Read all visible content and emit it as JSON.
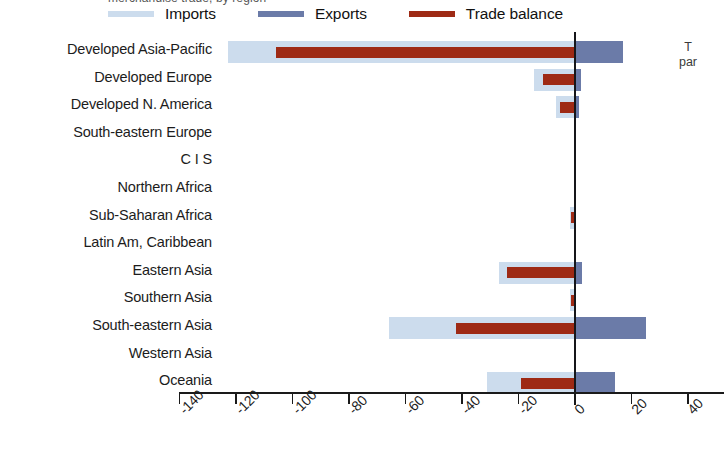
{
  "top_cut_text": "merchandise trade, by region",
  "legend": {
    "items": [
      {
        "label": "Imports",
        "color": "#ccdced",
        "icon": "legend-line-imports"
      },
      {
        "label": "Exports",
        "color": "#6b7ba8",
        "icon": "legend-line-exports"
      },
      {
        "label": "Trade balance",
        "color": "#9e2a15",
        "icon": "legend-line-trade-balance"
      }
    ]
  },
  "side_note": {
    "line1": "T",
    "line2": "par"
  },
  "colors": {
    "imports": "#ccdced",
    "exports": "#6b7ba8",
    "trade_balance": "#9e2a15",
    "axis": "#1a1a1a",
    "zero_line": "#16161a"
  },
  "chart_data": {
    "type": "bar",
    "orientation": "horizontal",
    "title": "",
    "subtitle": "",
    "xlabel": "",
    "ylabel": "",
    "xlim": [
      -145,
      45
    ],
    "xticks": [
      -140,
      -120,
      -100,
      -80,
      -60,
      -40,
      -20,
      0,
      20,
      40
    ],
    "xticklabels": [
      "-140",
      "-120",
      "-100",
      "-80",
      "-60",
      "-40",
      "-20",
      "0",
      "20",
      "40"
    ],
    "grid": false,
    "legend_position": "top",
    "categories": [
      "Developed Asia-Pacific",
      "Developed Europe",
      "Developed N. America",
      "South-eastern Europe",
      "C I S",
      "Northern Africa",
      "Sub-Saharan Africa",
      "Latin Am, Caribbean",
      "Eastern Asia",
      "Southern Asia",
      "South-eastern Asia",
      "Western Asia",
      "Oceania"
    ],
    "series": [
      {
        "name": "Imports",
        "color": "#ccdced",
        "note": "plotted as negative values extending left of zero",
        "values": [
          -123,
          -14.5,
          -6.7,
          -0.4,
          -0.3,
          -0.4,
          -1.6,
          -0.5,
          -27,
          -1.6,
          -66,
          -0.5,
          -31
        ]
      },
      {
        "name": "Exports",
        "color": "#6b7ba8",
        "note": "plotted as positive values extending right of zero",
        "values": [
          17,
          2,
          1.5,
          0.3,
          0.2,
          0.3,
          0.4,
          0.3,
          2.5,
          0.4,
          25,
          0.4,
          14
        ]
      },
      {
        "name": "Trade balance",
        "color": "#9e2a15",
        "note": "net balance bar drawn from its value to zero",
        "values": [
          -106,
          -11.5,
          -5.2,
          -0.2,
          -0.2,
          -0.3,
          -1.3,
          -0.3,
          -24,
          -1.3,
          -42,
          -0.3,
          -19
        ]
      }
    ]
  }
}
